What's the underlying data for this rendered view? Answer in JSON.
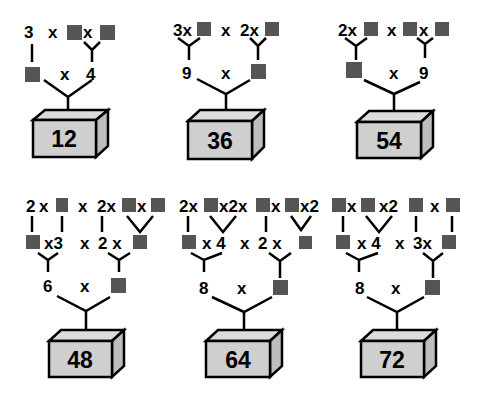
{
  "colors": {
    "blank_square": "#555555",
    "box_front": "#cfcfcf",
    "box_top": "#dcdcdc",
    "box_side": "#bdbdbd",
    "ink": "#000000"
  },
  "blank_symbol": "blank-square",
  "trees": [
    {
      "product": "12",
      "level2": [
        "3",
        "x",
        "■",
        "x",
        "■"
      ],
      "level1": [
        "■",
        "x",
        "4"
      ]
    },
    {
      "product": "36",
      "level2": [
        "3",
        "x",
        "■",
        "x",
        "2",
        "x",
        "■"
      ],
      "level1": [
        "9",
        "x",
        "■"
      ]
    },
    {
      "product": "54",
      "level2": [
        "2",
        "x",
        "■",
        "x",
        "■",
        "x",
        "■"
      ],
      "level1": [
        "■",
        "x",
        "9"
      ]
    },
    {
      "product": "48",
      "level3": [
        "2",
        "x",
        "■",
        "x",
        "2",
        "x",
        "■",
        "x",
        "■"
      ],
      "level2": [
        "■",
        "x",
        "3",
        "x",
        "2",
        "x",
        "■"
      ],
      "level1": [
        "6",
        "x",
        "■"
      ]
    },
    {
      "product": "64",
      "level3": [
        "2",
        "x",
        "■",
        "x",
        "2",
        "x",
        "■",
        "x",
        "■",
        "x",
        "2"
      ],
      "level2": [
        "■",
        "x",
        "4",
        "x",
        "2",
        "x",
        "■"
      ],
      "level1": [
        "8",
        "x",
        "■"
      ]
    },
    {
      "product": "72",
      "level3": [
        "■",
        "x",
        "■",
        "x",
        "2",
        "■",
        "x",
        "■"
      ],
      "level2": [
        "■",
        "x",
        "4",
        "x",
        "3",
        "x",
        "■"
      ],
      "level1": [
        "8",
        "x",
        "■"
      ]
    }
  ],
  "labels": {
    "t0_l2_a": "3",
    "t0_l2_x1": "x",
    "t0_l2_x2": "x",
    "t0_l1_x": "x",
    "t0_l1_b": "4",
    "t0_prod": "12",
    "t1_l2_a": "3x",
    "t1_l2_x": "x",
    "t1_l2_b": "2x",
    "t1_l1_a": "9",
    "t1_l1_x": "x",
    "t1_prod": "36",
    "t2_l2_a": "2x",
    "t2_l2_x1": "x",
    "t2_l2_x2": "x",
    "t2_l1_x": "x",
    "t2_l1_b": "9",
    "t2_prod": "54",
    "t3_l3_a": "2",
    "t3_l3_x1": "x",
    "t3_l3_x2": "x",
    "t3_l3_b": "2x",
    "t3_l3_x3": "x",
    "t3_l2_x3": "x3",
    "t3_l2_x": "x",
    "t3_l2_2x": "2 x",
    "t3_l1_a": "6",
    "t3_l1_x": "x",
    "t3_prod": "48",
    "t4_l3_a": "2x",
    "t4_l3_b": "x2x",
    "t4_l3_c": "x",
    "t4_l3_d": "x2",
    "t4_l2_x4": "x 4",
    "t4_l2_x": "x",
    "t4_l2_2x": "2 x",
    "t4_l1_a": "8",
    "t4_l1_x": "x",
    "t4_prod": "64",
    "t5_l3_x1": "x",
    "t5_l3_x2": "x2",
    "t5_l3_x3": "x",
    "t5_l2_x4": "x 4",
    "t5_l2_x": "x",
    "t5_l2_3x": "3x",
    "t5_l1_a": "8",
    "t5_l1_x": "x",
    "t5_prod": "72"
  }
}
